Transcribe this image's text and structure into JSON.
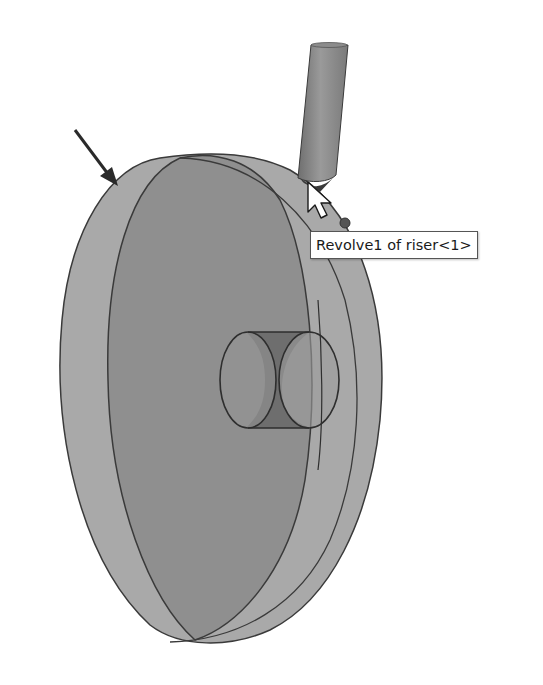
{
  "viewport": {
    "name": "3D graphics area",
    "background": "#ffffff"
  },
  "model": {
    "part": "casting with riser",
    "outer_face_color": "#a8a8a8",
    "inner_face_color": "#8e8e8e",
    "edge_color": "#3a3a3a",
    "riser_color": "#8a8a8a",
    "hole_shadow_color": "#6e6e6e"
  },
  "annotations": {
    "arrow": "pointer arrow indicating outer face",
    "cursor": "select cursor",
    "dot": "selection point"
  },
  "tooltip": {
    "text": "Revolve1 of riser<1>"
  }
}
